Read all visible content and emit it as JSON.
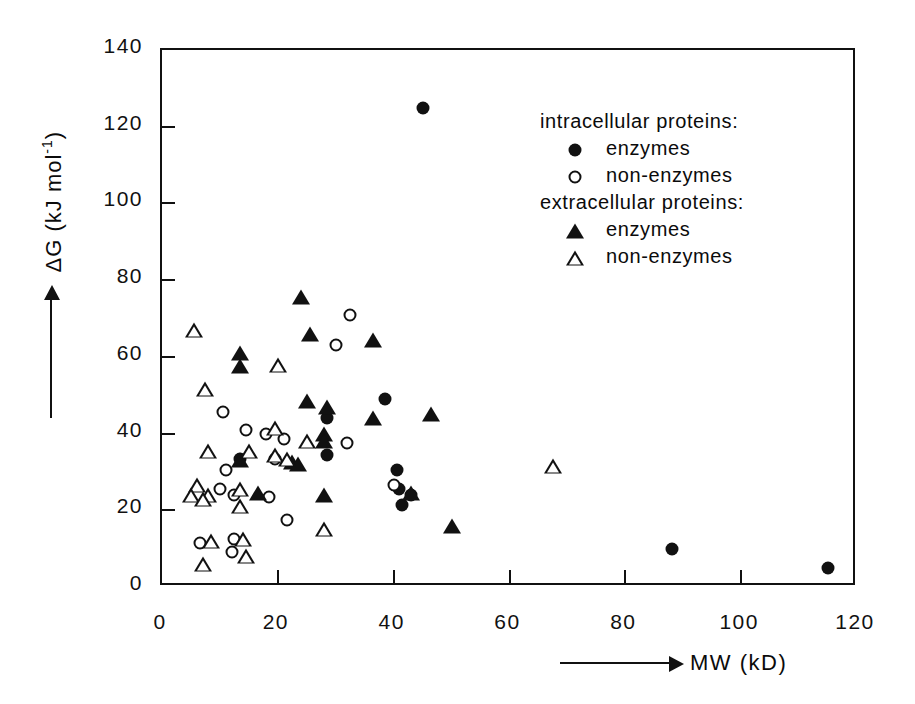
{
  "chart_data": {
    "type": "scatter",
    "title": "",
    "xlabel": "MW (kD)",
    "ylabel": "ΔG (kJ mol⁻¹)",
    "xlim": [
      0,
      120
    ],
    "ylim": [
      0,
      140
    ],
    "xticks": [
      "0",
      "20",
      "40",
      "60",
      "80",
      "100",
      "120"
    ],
    "xtick_values": [
      0,
      20,
      40,
      60,
      80,
      100,
      120
    ],
    "yticks": [
      "0",
      "20",
      "40",
      "60",
      "80",
      "100",
      "120",
      "140"
    ],
    "ytick_values": [
      0,
      20,
      40,
      60,
      80,
      100,
      120,
      140
    ],
    "grid": false,
    "legend_position": "upper-right-inside",
    "series": [
      {
        "name": "intracellular enzymes",
        "marker": "circle-filled",
        "points": [
          [
            45.0,
            125.0
          ],
          [
            38.5,
            49.0
          ],
          [
            28.5,
            44.0
          ],
          [
            28.5,
            34.5
          ],
          [
            40.5,
            30.5
          ],
          [
            41.0,
            25.5
          ],
          [
            43.0,
            24.0
          ],
          [
            41.5,
            21.5
          ],
          [
            13.5,
            33.5
          ],
          [
            88.0,
            9.8
          ],
          [
            115.0,
            5.0
          ]
        ]
      },
      {
        "name": "intracellular non-enzymes",
        "marker": "circle-open",
        "points": [
          [
            32.5,
            71.0
          ],
          [
            30.0,
            63.0
          ],
          [
            10.5,
            45.5
          ],
          [
            14.5,
            41.0
          ],
          [
            18.0,
            40.0
          ],
          [
            21.0,
            38.5
          ],
          [
            32.0,
            37.5
          ],
          [
            19.5,
            33.5
          ],
          [
            11.0,
            30.5
          ],
          [
            10.0,
            25.5
          ],
          [
            40.0,
            26.5
          ],
          [
            12.5,
            24.0
          ],
          [
            18.5,
            23.5
          ],
          [
            21.5,
            17.5
          ],
          [
            6.5,
            11.5
          ],
          [
            12.5,
            12.5
          ],
          [
            12.0,
            9.0
          ]
        ]
      },
      {
        "name": "extracellular enzymes",
        "marker": "triangle-filled",
        "points": [
          [
            24.0,
            75.5
          ],
          [
            25.5,
            66.0
          ],
          [
            36.5,
            64.5
          ],
          [
            13.5,
            61.0
          ],
          [
            13.5,
            57.5
          ],
          [
            25.0,
            48.5
          ],
          [
            28.5,
            47.0
          ],
          [
            36.5,
            44.0
          ],
          [
            46.5,
            45.0
          ],
          [
            28.0,
            40.0
          ],
          [
            28.0,
            38.0
          ],
          [
            13.5,
            33.0
          ],
          [
            22.5,
            32.5
          ],
          [
            23.5,
            32.0
          ],
          [
            16.5,
            24.5
          ],
          [
            28.0,
            24.0
          ],
          [
            43.0,
            24.5
          ],
          [
            50.0,
            16.0
          ]
        ]
      },
      {
        "name": "extracellular non-enzymes",
        "marker": "triangle-open",
        "points": [
          [
            5.5,
            67.0
          ],
          [
            7.5,
            51.5
          ],
          [
            20.0,
            58.0
          ],
          [
            8.0,
            35.5
          ],
          [
            15.0,
            35.5
          ],
          [
            19.5,
            41.5
          ],
          [
            19.5,
            34.5
          ],
          [
            21.5,
            33.5
          ],
          [
            25.0,
            38.0
          ],
          [
            6.0,
            26.5
          ],
          [
            5.0,
            24.0
          ],
          [
            8.0,
            24.0
          ],
          [
            7.0,
            23.0
          ],
          [
            13.5,
            25.5
          ],
          [
            13.5,
            21.0
          ],
          [
            67.5,
            31.5
          ],
          [
            28.0,
            15.0
          ],
          [
            8.5,
            12.0
          ],
          [
            14.0,
            12.5
          ],
          [
            14.5,
            8.0
          ],
          [
            7.0,
            6.0
          ]
        ]
      }
    ]
  },
  "legend": {
    "heading_intracellular": "intracellular proteins:",
    "heading_extracellular": "extracellular proteins:",
    "enzymes_label": "enzymes",
    "non_enzymes_label": "non-enzymes"
  },
  "axes": {
    "y_title_main": "ΔG",
    "y_title_units": "(kJ mol",
    "y_title_exponent": "-1",
    "y_title_close": ")",
    "x_title": "MW (kD)"
  }
}
